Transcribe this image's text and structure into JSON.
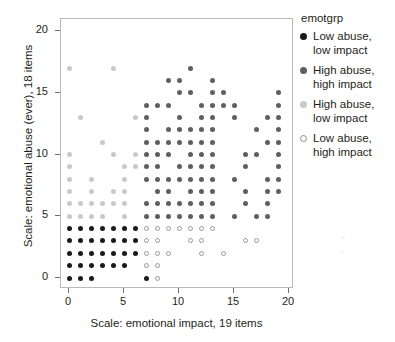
{
  "chart_data": {
    "type": "scatter",
    "title": "",
    "xlabel": "Scale: emotional impact, 19 items",
    "ylabel": "Scale: emotional abuse (ever), 18 items",
    "xlim": [
      -1,
      21
    ],
    "ylim": [
      -1.5,
      21
    ],
    "xticks": [
      0,
      5,
      10,
      15,
      20
    ],
    "yticks": [
      0,
      5,
      10,
      15,
      20
    ],
    "xticklabels": [
      "0",
      "5",
      "10",
      "15",
      "20"
    ],
    "yticklabels": [
      "0",
      "5",
      "10",
      "15",
      "20"
    ],
    "grid": false,
    "legend_position": "right",
    "legend_title": "emotgrp",
    "series": [
      {
        "name": "Low abuse, low impact",
        "color": "#1a1a1a",
        "marker": "filled-circle",
        "points": [
          [
            0,
            0
          ],
          [
            1,
            0
          ],
          [
            2,
            0
          ],
          [
            7,
            0
          ],
          [
            0,
            1
          ],
          [
            1,
            1
          ],
          [
            2,
            1
          ],
          [
            3,
            1
          ],
          [
            4,
            1
          ],
          [
            5,
            1
          ],
          [
            0,
            2
          ],
          [
            1,
            2
          ],
          [
            2,
            2
          ],
          [
            3,
            2
          ],
          [
            4,
            2
          ],
          [
            5,
            2
          ],
          [
            6,
            2
          ],
          [
            0,
            3
          ],
          [
            1,
            3
          ],
          [
            2,
            3
          ],
          [
            3,
            3
          ],
          [
            4,
            3
          ],
          [
            5,
            3
          ],
          [
            6,
            3
          ],
          [
            0,
            4
          ],
          [
            1,
            4
          ],
          [
            2,
            4
          ],
          [
            3,
            4
          ],
          [
            4,
            4
          ],
          [
            5,
            4
          ],
          [
            6,
            4
          ]
        ]
      },
      {
        "name": "High abuse, high impact",
        "color": "#5e5e63",
        "marker": "filled-circle",
        "points": [
          [
            11,
            17
          ],
          [
            9,
            16
          ],
          [
            10,
            16
          ],
          [
            13,
            16
          ],
          [
            10,
            15
          ],
          [
            11,
            15
          ],
          [
            13,
            15
          ],
          [
            14,
            15
          ],
          [
            19,
            15
          ],
          [
            7,
            14
          ],
          [
            8,
            14
          ],
          [
            9,
            14
          ],
          [
            12,
            14
          ],
          [
            13,
            14
          ],
          [
            14,
            14
          ],
          [
            15,
            14
          ],
          [
            19,
            14
          ],
          [
            7,
            13
          ],
          [
            10,
            13
          ],
          [
            12,
            13
          ],
          [
            13,
            13
          ],
          [
            15,
            13
          ],
          [
            18,
            13
          ],
          [
            19,
            13
          ],
          [
            7,
            12
          ],
          [
            9,
            12
          ],
          [
            10,
            12
          ],
          [
            11,
            12
          ],
          [
            12,
            12
          ],
          [
            13,
            12
          ],
          [
            17,
            12
          ],
          [
            19,
            12
          ],
          [
            7,
            11
          ],
          [
            8,
            11
          ],
          [
            9,
            11
          ],
          [
            10,
            11
          ],
          [
            11,
            11
          ],
          [
            12,
            11
          ],
          [
            13,
            11
          ],
          [
            18,
            11
          ],
          [
            19,
            11
          ],
          [
            7,
            10
          ],
          [
            8,
            10
          ],
          [
            9,
            10
          ],
          [
            11,
            10
          ],
          [
            12,
            10
          ],
          [
            13,
            10
          ],
          [
            16,
            10
          ],
          [
            17,
            10
          ],
          [
            19,
            10
          ],
          [
            7,
            9
          ],
          [
            8,
            9
          ],
          [
            10,
            9
          ],
          [
            11,
            9
          ],
          [
            12,
            9
          ],
          [
            13,
            9
          ],
          [
            16,
            9
          ],
          [
            19,
            9
          ],
          [
            7,
            8
          ],
          [
            8,
            8
          ],
          [
            9,
            8
          ],
          [
            10,
            8
          ],
          [
            11,
            8
          ],
          [
            12,
            8
          ],
          [
            13,
            8
          ],
          [
            15,
            8
          ],
          [
            18,
            8
          ],
          [
            19,
            8
          ],
          [
            8,
            7
          ],
          [
            9,
            7
          ],
          [
            11,
            7
          ],
          [
            12,
            7
          ],
          [
            13,
            7
          ],
          [
            16,
            7
          ],
          [
            18,
            7
          ],
          [
            19,
            7
          ],
          [
            7,
            6
          ],
          [
            8,
            6
          ],
          [
            9,
            6
          ],
          [
            10,
            6
          ],
          [
            11,
            6
          ],
          [
            12,
            6
          ],
          [
            13,
            6
          ],
          [
            16,
            6
          ],
          [
            18,
            6
          ],
          [
            7,
            5
          ],
          [
            8,
            5
          ],
          [
            9,
            5
          ],
          [
            10,
            5
          ],
          [
            11,
            5
          ],
          [
            12,
            5
          ],
          [
            13,
            5
          ],
          [
            15,
            5
          ],
          [
            17,
            5
          ],
          [
            18,
            5
          ]
        ]
      },
      {
        "name": "High abuse, low impact",
        "color": "#c9c9cd",
        "marker": "filled-circle",
        "points": [
          [
            0,
            17
          ],
          [
            4,
            17
          ],
          [
            1,
            13
          ],
          [
            6,
            13
          ],
          [
            3,
            11
          ],
          [
            0,
            10
          ],
          [
            4,
            10
          ],
          [
            6,
            10
          ],
          [
            0,
            9
          ],
          [
            5,
            9
          ],
          [
            6,
            9
          ],
          [
            0,
            8
          ],
          [
            2,
            8
          ],
          [
            5,
            8
          ],
          [
            0,
            7
          ],
          [
            2,
            7
          ],
          [
            4,
            7
          ],
          [
            5,
            7
          ],
          [
            0,
            6
          ],
          [
            1,
            6
          ],
          [
            2,
            6
          ],
          [
            3,
            6
          ],
          [
            4,
            6
          ],
          [
            5,
            6
          ],
          [
            0,
            5
          ],
          [
            1,
            5
          ],
          [
            2,
            5
          ],
          [
            3,
            5
          ],
          [
            5,
            5
          ]
        ]
      },
      {
        "name": "Low abuse, high impact",
        "color": "#ffffff",
        "marker": "open-circle",
        "points": [
          [
            8,
            0
          ],
          [
            7,
            1
          ],
          [
            8,
            1
          ],
          [
            7,
            2
          ],
          [
            8,
            2
          ],
          [
            9,
            2
          ],
          [
            12,
            2
          ],
          [
            14,
            2
          ],
          [
            7,
            3
          ],
          [
            8,
            3
          ],
          [
            11,
            3
          ],
          [
            12,
            3
          ],
          [
            16,
            3
          ],
          [
            17,
            3
          ],
          [
            7,
            4
          ],
          [
            8,
            4
          ],
          [
            9,
            4
          ],
          [
            10,
            4
          ],
          [
            11,
            4
          ],
          [
            12,
            4
          ],
          [
            13,
            4
          ]
        ]
      }
    ]
  },
  "legend": {
    "title": "emotgrp",
    "items": [
      {
        "label_line1": "Low abuse,",
        "label_line2": "low impact",
        "swatch": "g0"
      },
      {
        "label_line1": "High abuse,",
        "label_line2": "high impact",
        "swatch": "g1"
      },
      {
        "label_line1": "High abuse,",
        "label_line2": "low impact",
        "swatch": "g2"
      },
      {
        "label_line1": "Low abuse,",
        "label_line2": "high impact",
        "swatch": "g3"
      }
    ]
  }
}
